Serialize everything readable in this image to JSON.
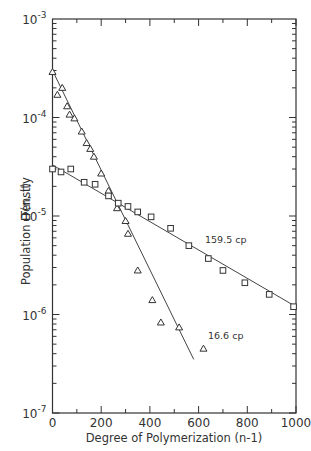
{
  "chart_data": {
    "type": "scatter",
    "title": "",
    "xlabel": "Degree of Polymerization (n-1)",
    "ylabel": "Population Density",
    "ylabel_secondary": "T(n, t)",
    "xlim": [
      0,
      1000
    ],
    "ylim": [
      1e-07,
      0.001
    ],
    "yscale": "log",
    "x_ticks": [
      0,
      200,
      400,
      600,
      800,
      1000
    ],
    "x_tick_labels": [
      "0",
      "200",
      "400",
      "600",
      "800",
      "1000"
    ],
    "y_ticks": [
      0.001,
      0.0001,
      1e-05,
      1e-06,
      1e-07
    ],
    "y_tick_labels": [
      {
        "base": "10",
        "exp": "-3"
      },
      {
        "base": "10",
        "exp": "-4"
      },
      {
        "base": "10",
        "exp": "-5"
      },
      {
        "base": "10",
        "exp": "-6"
      },
      {
        "base": "10",
        "exp": "-7"
      }
    ],
    "grid": false,
    "legend": "none (inline annotations)",
    "series": [
      {
        "name": "16.6 cp",
        "marker": "triangle",
        "x": [
          0,
          20,
          40,
          60,
          70,
          90,
          120,
          140,
          155,
          170,
          200,
          230,
          265,
          300,
          310,
          350,
          410,
          445,
          520,
          620
        ],
        "y": [
          0.00029,
          0.00017,
          0.0002,
          0.00013,
          0.000107,
          9.8e-05,
          7.2e-05,
          5.5e-05,
          4.8e-05,
          4e-05,
          2.7e-05,
          1.8e-05,
          1.2e-05,
          8.9e-06,
          6.6e-06,
          2.8e-06,
          1.4e-06,
          8.3e-07,
          7.4e-07,
          4.5e-07
        ],
        "fit_line": {
          "x": [
            0,
            580
          ],
          "y": [
            0.0003,
            3.5e-07
          ]
        },
        "annotation": {
          "text": "16.6 cp",
          "x": 590,
          "y": 6e-07
        }
      },
      {
        "name": "159.5 cp",
        "marker": "square",
        "x": [
          0,
          35,
          75,
          130,
          175,
          230,
          270,
          310,
          350,
          405,
          485,
          560,
          640,
          700,
          790,
          890,
          990
        ],
        "y": [
          3e-05,
          2.8e-05,
          3e-05,
          2.2e-05,
          2.1e-05,
          1.6e-05,
          1.35e-05,
          1.25e-05,
          1.1e-05,
          9.8e-06,
          7.5e-06,
          5e-06,
          3.7e-06,
          2.8e-06,
          2.1e-06,
          1.6e-06,
          1.2e-06
        ],
        "fit_line": {
          "x": [
            0,
            1000
          ],
          "y": [
            3.3e-05,
            1.2e-06
          ]
        },
        "annotation": {
          "text": "159.5 cp",
          "x": 640,
          "y": 6e-06
        }
      }
    ]
  },
  "labels": {
    "x_axis": "Degree of Polymerization (n-1)",
    "y_axis": "Population Density",
    "y_axis_secondary": "T(n, t)",
    "annotation_high": "159.5 cp",
    "annotation_low": "16.6 cp"
  }
}
